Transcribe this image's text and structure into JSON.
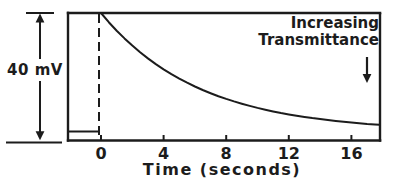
{
  "colors": {
    "ink": "#1c1c1c",
    "background": "#ffffff"
  },
  "figure": {
    "amplitude_label": "40 mV",
    "annotation_label": "Increasing Transmittance",
    "x_axis_label": "Time (seconds)"
  },
  "chart_data": {
    "type": "line",
    "title": "",
    "xlabel": "Time (seconds)",
    "ylabel": "",
    "x_ticks": [
      0,
      4,
      8,
      12,
      16
    ],
    "xlim": [
      -2.1,
      17.9
    ],
    "ylim_mV": [
      -3,
      43
    ],
    "grid": false,
    "legend": false,
    "annotations": [
      {
        "text": "40 mV",
        "meaning": "vertical double-headed arrow showing full-scale signal amplitude at left of plot"
      },
      {
        "text": "Increasing Transmittance",
        "meaning": "label with downward arrow at upper right indicating direction of increasing transmittance"
      }
    ],
    "jump": {
      "t": 0,
      "from_mV": 0,
      "to_mV": 40,
      "style": "dashed-vertical"
    },
    "series": [
      {
        "name": "pre-trigger-baseline",
        "points": [
          [
            -2.05,
            0
          ],
          [
            -0.15,
            0
          ]
        ]
      },
      {
        "name": "exponential-decay-after-40mV-jump",
        "points": [
          [
            0,
            40.0
          ],
          [
            0.5,
            36.9
          ],
          [
            1,
            34.04
          ],
          [
            1.5,
            31.41
          ],
          [
            2,
            28.98
          ],
          [
            2.5,
            26.73
          ],
          [
            3,
            24.66
          ],
          [
            3.5,
            22.75
          ],
          [
            4,
            20.99
          ],
          [
            4.5,
            19.36
          ],
          [
            5,
            17.86
          ],
          [
            5.5,
            16.48
          ],
          [
            6,
            15.2
          ],
          [
            6.5,
            14.02
          ],
          [
            7,
            12.94
          ],
          [
            7.5,
            11.93
          ],
          [
            8,
            11.01
          ],
          [
            8.5,
            10.16
          ],
          [
            9,
            9.37
          ],
          [
            9.5,
            8.64
          ],
          [
            10,
            7.97
          ],
          [
            10.5,
            7.36
          ],
          [
            11,
            6.79
          ],
          [
            11.5,
            6.26
          ],
          [
            12,
            5.78
          ],
          [
            12.5,
            5.33
          ],
          [
            13,
            4.92
          ],
          [
            13.5,
            4.53
          ],
          [
            14,
            4.18
          ],
          [
            14.5,
            3.86
          ],
          [
            15,
            3.56
          ],
          [
            15.5,
            3.28
          ],
          [
            16,
            3.03
          ],
          [
            16.5,
            2.79
          ],
          [
            17,
            2.58
          ],
          [
            17.5,
            2.38
          ],
          [
            17.8,
            2.26
          ]
        ]
      }
    ]
  }
}
